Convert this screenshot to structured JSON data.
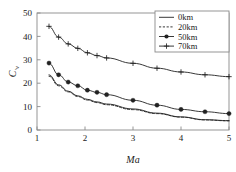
{
  "chart_data": {
    "type": "line",
    "title": "",
    "xlabel": "Ma",
    "ylabel": "C'v",
    "xlim": [
      1,
      5
    ],
    "ylim": [
      0,
      50
    ],
    "xticks": [
      1,
      2,
      3,
      4,
      5
    ],
    "yticks": [
      0,
      10,
      20,
      30,
      40,
      50
    ],
    "grid": false,
    "legend_position": "top-right",
    "series": [
      {
        "name": "0km",
        "style": "solid",
        "marker": "none",
        "x": [
          1.25,
          1.45,
          1.65,
          1.85,
          2.05,
          2.25,
          2.45,
          3.0,
          3.5,
          4.0,
          4.5,
          5.0
        ],
        "y": [
          23.6,
          19.3,
          16.6,
          14.6,
          13.1,
          12.0,
          11.1,
          9.0,
          7.2,
          5.6,
          4.4,
          4.0
        ]
      },
      {
        "name": "20km",
        "style": "dashed",
        "marker": "none",
        "x": [
          1.25,
          1.45,
          1.65,
          1.85,
          2.05,
          2.25,
          2.45,
          3.0,
          3.5,
          4.0,
          4.5,
          5.0
        ],
        "y": [
          23.0,
          18.9,
          16.3,
          14.3,
          12.8,
          11.7,
          10.8,
          8.7,
          7.0,
          5.5,
          4.3,
          3.9
        ]
      },
      {
        "name": "50km",
        "style": "solid",
        "marker": "filled-circle",
        "x": [
          1.25,
          1.45,
          1.65,
          1.85,
          2.05,
          2.25,
          2.45,
          3.0,
          3.5,
          4.0,
          4.5,
          5.0
        ],
        "y": [
          28.6,
          23.6,
          20.5,
          18.9,
          17.0,
          16.1,
          15.1,
          12.7,
          10.6,
          8.8,
          7.8,
          7.0
        ]
      },
      {
        "name": "70km",
        "style": "solid",
        "marker": "plus",
        "x": [
          1.25,
          1.45,
          1.65,
          1.85,
          2.05,
          2.25,
          2.45,
          3.0,
          3.5,
          4.0,
          4.5,
          5.0
        ],
        "y": [
          44.3,
          39.7,
          36.8,
          34.9,
          33.0,
          31.8,
          30.8,
          28.5,
          26.4,
          24.8,
          23.6,
          22.8
        ]
      }
    ]
  },
  "legend": {
    "items": [
      {
        "label": "0km"
      },
      {
        "label": "20km"
      },
      {
        "label": "50km"
      },
      {
        "label": "70km"
      }
    ]
  },
  "colors": {
    "ink": "#1a1a1a",
    "frame": "#8a8a8a",
    "series": "#222222"
  }
}
